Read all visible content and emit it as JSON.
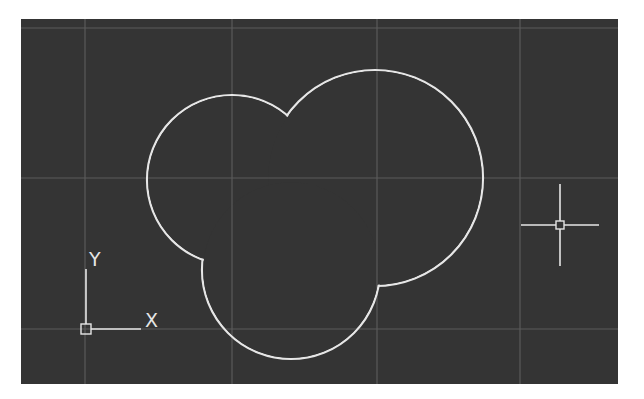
{
  "app": {
    "type": "CAD drawing viewport",
    "background_color": "#343434",
    "grid_color": "#5a5a5a",
    "geometry_color": "#e6e6e6"
  },
  "viewport": {
    "grid": {
      "vertical_lines_x": [
        85,
        232,
        377,
        520
      ],
      "horizontal_lines_y": [
        28,
        178,
        329
      ]
    },
    "ucs_icon": {
      "name": "ucs-icon",
      "x_label": "X",
      "y_label": "Y",
      "origin": [
        86,
        329
      ]
    },
    "crosshair_cursor": {
      "center": [
        560,
        225
      ],
      "half_width": 39,
      "half_height": 41,
      "pickbox_size": 8
    },
    "drawing": {
      "description": "Region formed by union of three overlapping circles",
      "circles": [
        {
          "name": "left-circle",
          "cx": 232,
          "cy": 180,
          "r": 85
        },
        {
          "name": "right-circle",
          "cx": 375,
          "cy": 178,
          "r": 108
        },
        {
          "name": "bottom-circle",
          "cx": 291,
          "cy": 270,
          "r": 89
        }
      ],
      "outline_points": {
        "top_cusp": [
          288,
          119
        ],
        "left_bottom_cusp": [
          202,
          258
        ],
        "right_bottom_cusp": [
          375,
          287
        ]
      }
    }
  }
}
